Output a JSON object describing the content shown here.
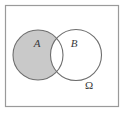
{
  "figure": {
    "type": "venn-diagram",
    "title_visible": false,
    "background_color": "#ffffff",
    "frame": {
      "name": "universe-rectangle",
      "x": 5,
      "y": 5,
      "width": 114,
      "height": 102,
      "stroke_color": "#9a9a9a",
      "fill_color": "#ffffff",
      "stroke_width": 1.2
    },
    "circles": [
      {
        "name": "set-a-circle",
        "label": "A",
        "cx": 38,
        "cy": 55,
        "r": 25,
        "stroke_color": "#6e6e6e",
        "fill_color": "#ffffff"
      },
      {
        "name": "set-b-circle",
        "label": "B",
        "cx": 76,
        "cy": 55,
        "r": 25.5,
        "stroke_color": "#6e6e6e",
        "fill_color": "#ffffff"
      }
    ],
    "shaded_region": {
      "name": "a-minus-b-region",
      "description": "A \\ B",
      "fill_color": "#c9c9c9"
    },
    "labels": {
      "set_a": "A",
      "set_b": "B",
      "universe": "Ω"
    },
    "label_positions": {
      "set_a": {
        "x": 37,
        "y": 47
      },
      "set_b": {
        "x": 74,
        "y": 47
      },
      "universe": {
        "x": 89,
        "y": 89
      }
    }
  },
  "chart_data": {
    "type": "diagram",
    "title": "",
    "sets": [
      "A",
      "B"
    ],
    "universe": "Ω",
    "shaded": [
      "A \\ B"
    ],
    "regions": [
      {
        "id": "A-only",
        "label": "A \\ B",
        "shaded": true
      },
      {
        "id": "A-and-B",
        "label": "A ∩ B",
        "shaded": false
      },
      {
        "id": "B-only",
        "label": "B \\ A",
        "shaded": false
      },
      {
        "id": "outside",
        "label": "Ω \\ (A ∪ B)",
        "shaded": false
      }
    ]
  }
}
